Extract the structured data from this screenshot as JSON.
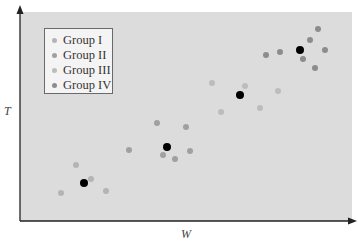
{
  "chart_data": {
    "type": "scatter",
    "title": "",
    "xlabel": "W",
    "ylabel": "T",
    "grid": false,
    "ticks": false,
    "legend_position": "upper-left",
    "coordinate_note": "pixel coordinates within image; no numeric axes shown",
    "series": [
      {
        "name": "Group I",
        "color": "#b4b4b4",
        "points": [
          [
            61,
            193
          ],
          [
            76,
            165
          ],
          [
            106,
            191
          ],
          [
            91,
            179
          ]
        ]
      },
      {
        "name": "Group II",
        "color": "#a0a0a0",
        "points": [
          [
            129,
            150
          ],
          [
            157,
            123
          ],
          [
            163,
            155
          ],
          [
            175,
            159
          ],
          [
            186,
            127
          ],
          [
            190,
            151
          ]
        ]
      },
      {
        "name": "Group III",
        "color": "#bcbcbc",
        "points": [
          [
            212,
            83
          ],
          [
            221,
            112
          ],
          [
            245,
            86
          ],
          [
            260,
            108
          ],
          [
            278,
            91
          ]
        ]
      },
      {
        "name": "Group IV",
        "color": "#8c8c8c",
        "points": [
          [
            266,
            55
          ],
          [
            280,
            52
          ],
          [
            303,
            59
          ],
          [
            310,
            40
          ],
          [
            315,
            68
          ],
          [
            318,
            29
          ],
          [
            325,
            50
          ]
        ]
      },
      {
        "name": "Group centroids",
        "color": "#000000",
        "legend": false,
        "points": [
          [
            84,
            183
          ],
          [
            167,
            147
          ],
          [
            240,
            95
          ],
          [
            300,
            50
          ]
        ]
      }
    ]
  },
  "legend": {
    "items": [
      {
        "label": "Group I",
        "color": "#b4b4b4"
      },
      {
        "label": "Group II",
        "color": "#a0a0a0"
      },
      {
        "label": "Group III",
        "color": "#bcbcbc"
      },
      {
        "label": "Group IV",
        "color": "#8c8c8c"
      }
    ]
  },
  "axes": {
    "x_label": "W",
    "y_label": "T"
  },
  "style": {
    "panel_color": "#dcdcdc",
    "axis_color": "#222222",
    "centroid_color": "#000000"
  }
}
